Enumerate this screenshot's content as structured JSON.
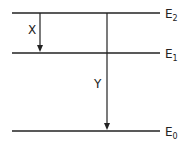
{
  "diagram": {
    "type": "energy-level-diagram",
    "levels": [
      {
        "name": "E2",
        "base": "E",
        "sub": "2",
        "y": 13
      },
      {
        "name": "E1",
        "base": "E",
        "sub": "1",
        "y": 53
      },
      {
        "name": "E0",
        "base": "E",
        "sub": "0",
        "y": 131
      }
    ],
    "transitions": [
      {
        "label": "X",
        "from": "E2",
        "to": "E1"
      },
      {
        "label": "Y",
        "from": "E2",
        "to": "E0"
      }
    ],
    "colors": {
      "line": "#222222",
      "background": "#ffffff"
    }
  }
}
